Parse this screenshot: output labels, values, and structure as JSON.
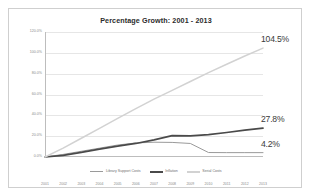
{
  "chart_data": {
    "type": "line",
    "title": "Percentage Growth: 2001 - 2013",
    "xlabel": "",
    "ylabel": "",
    "categories": [
      2001,
      2002,
      2003,
      2004,
      2005,
      2006,
      2007,
      2008,
      2009,
      2010,
      2011,
      2012,
      2013
    ],
    "xtick_labels": [
      "2001",
      "2002",
      "2003",
      "2004",
      "2005",
      "2006",
      "2007",
      "2008",
      "2009",
      "2010",
      "2011",
      "2012",
      "2013"
    ],
    "ylim": [
      0,
      120
    ],
    "ytick_values": [
      0,
      20,
      40,
      60,
      80,
      100,
      120
    ],
    "ytick_labels": [
      "0.0%",
      "20.0%",
      "40.0%",
      "60.0%",
      "80.0%",
      "100.0%",
      "120.0%"
    ],
    "grid": true,
    "legend_position": "bottom",
    "series": [
      {
        "name": "Library Support Costs",
        "color": "#9a9a9a",
        "width": 1.0,
        "end_label": "4.2%",
        "values": [
          0.0,
          2.5,
          5.5,
          8.5,
          11.5,
          13.5,
          14.2,
          14.0,
          13.0,
          4.3,
          4.2,
          4.2,
          4.2
        ]
      },
      {
        "name": "Inflation",
        "color": "#4a4a4a",
        "width": 1.7,
        "end_label": "27.8%",
        "values": [
          0.0,
          1.5,
          4.5,
          7.5,
          10.5,
          13.0,
          16.5,
          20.5,
          20.3,
          21.5,
          23.5,
          25.8,
          27.8
        ]
      },
      {
        "name": "Serial Costs",
        "color": "#d2d2d2",
        "width": 1.5,
        "end_label": "104.5%",
        "values": [
          0.0,
          8.5,
          18.0,
          27.5,
          37.0,
          46.5,
          55.5,
          64.0,
          72.5,
          81.0,
          89.0,
          97.0,
          104.5
        ]
      }
    ],
    "data_labels": [
      {
        "text": "104.5%",
        "series": "Serial Costs"
      },
      {
        "text": "27.8%",
        "series": "Inflation"
      },
      {
        "text": "4.2%",
        "series": "Library Support Costs"
      }
    ]
  }
}
